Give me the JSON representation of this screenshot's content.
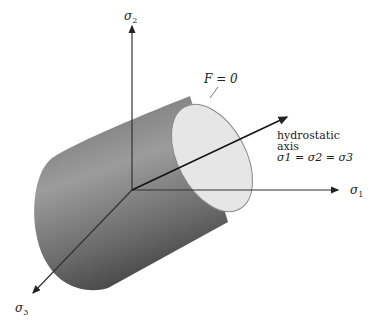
{
  "diagram": {
    "axes": {
      "sigma1": {
        "symbol": "σ",
        "sub": "1"
      },
      "sigma2": {
        "symbol": "σ",
        "sub": "2"
      },
      "sigma3": {
        "symbol": "σ",
        "sub": "3"
      }
    },
    "surface_label": "F = 0",
    "hydrostatic": {
      "line1": "hydrostatic",
      "line2": "axis",
      "equation": "σ1 = σ2 = σ3"
    },
    "colors": {
      "axis": "#333333",
      "cylinder_dark": "#555555",
      "cylinder_light": "#9a9a9a",
      "cap_fill": "#e6e6e6",
      "cap_stroke": "#888888"
    }
  }
}
